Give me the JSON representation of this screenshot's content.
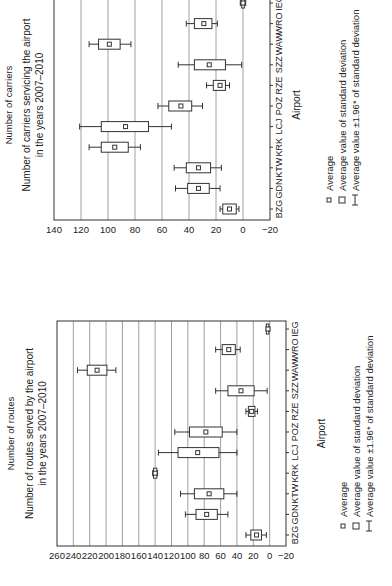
{
  "chart_data": [
    {
      "type": "box",
      "title": "Number of carriers servicing the airport in the years 2007–2010",
      "title_lines": [
        "Number of carriers servicing the airport",
        "in the years 2007–2010"
      ],
      "xlabel": "Airport",
      "ylabel": "Number of carriers",
      "ylim": [
        -20,
        140
      ],
      "yticks": [
        -20,
        0,
        20,
        40,
        60,
        80,
        100,
        120,
        140
      ],
      "grid": true,
      "categories": [
        "BZG",
        "GDN",
        "KTW",
        "KRK",
        "LCJ",
        "POZ",
        "RZE",
        "SZZ",
        "WAW",
        "WRO",
        "IEG"
      ],
      "series": [
        {
          "name": "Average",
          "values": [
            10,
            33,
            33,
            95,
            87,
            46,
            17,
            25,
            99,
            29,
            0
          ]
        },
        {
          "name": "Average value of standard deviation (low)",
          "values": [
            5,
            25,
            24,
            85,
            70,
            38,
            13,
            13,
            91,
            23,
            -1
          ]
        },
        {
          "name": "Average value of standard deviation (high)",
          "values": [
            15,
            41,
            42,
            105,
            105,
            55,
            22,
            36,
            107,
            36,
            1
          ]
        },
        {
          "name": "Average value ±1.96* of standard deviation (low)",
          "values": [
            3,
            17,
            16,
            76,
            53,
            30,
            10,
            1,
            83,
            19,
            -2
          ]
        },
        {
          "name": "Average value ±1.96* of standard deviation (high)",
          "values": [
            17,
            50,
            51,
            114,
            121,
            63,
            27,
            48,
            114,
            42,
            2
          ]
        }
      ],
      "legend": [
        "Average",
        "Average value of standard deviation",
        "Average value ±1.96* of standard deviation"
      ],
      "legend_position": "bottom"
    },
    {
      "type": "box",
      "title": "Number of routes served by the airport in the years 2007–2010",
      "title_lines": [
        "Number of routes served by the airport",
        "in the years 2007–2010"
      ],
      "xlabel": "Airport",
      "ylabel": "Number of routes",
      "ylim": [
        -20,
        260
      ],
      "yticks": [
        -20,
        0,
        20,
        40,
        60,
        80,
        100,
        120,
        140,
        160,
        180,
        200,
        220,
        240,
        260
      ],
      "grid": true,
      "categories": [
        "BZG",
        "GDN",
        "KTW",
        "KRK",
        "LCJ",
        "POZ",
        "RZE",
        "SZZ",
        "WAW",
        "WRO",
        "IEG"
      ],
      "series": [
        {
          "name": "Average",
          "values": [
            16,
            77,
            74,
            140,
            88,
            78,
            22,
            35,
            211,
            50,
            2
          ]
        },
        {
          "name": "Average value of standard deviation (low)",
          "values": [
            10,
            64,
            56,
            138,
            62,
            58,
            18,
            19,
            199,
            42,
            1
          ]
        },
        {
          "name": "Average value of standard deviation (high)",
          "values": [
            23,
            90,
            92,
            142,
            112,
            98,
            26,
            51,
            223,
            58,
            3
          ]
        },
        {
          "name": "Average value ±1.96* of standard deviation (low)",
          "values": [
            4,
            51,
            40,
            137,
            40,
            40,
            15,
            3,
            188,
            36,
            0
          ]
        },
        {
          "name": "Average value ±1.96* of standard deviation (high)",
          "values": [
            29,
            103,
            109,
            143,
            136,
            116,
            29,
            66,
            235,
            66,
            4
          ]
        }
      ],
      "legend": [
        "Average",
        "Average value of standard deviation",
        "Average value ±1.96* of standard deviation"
      ],
      "legend_position": "bottom"
    }
  ],
  "charts": {
    "carriers": {
      "title_line1": "Number of carriers servicing the airport",
      "title_line2": "in the years 2007–2010",
      "ylabel": "Number of carriers",
      "xlabel": "Airport"
    },
    "routes": {
      "title_line1": "Number of routes served by the airport",
      "title_line2": "in the years 2007–2010",
      "ylabel": "Number of routes",
      "xlabel": "Airport"
    }
  },
  "legend": {
    "average": "Average",
    "sd": "Average value of standard deviation",
    "ci": "Average value ±1.96* of standard deviation"
  },
  "colors": {
    "line": "#333333",
    "grid": "#888888",
    "background": "#ffffff"
  }
}
